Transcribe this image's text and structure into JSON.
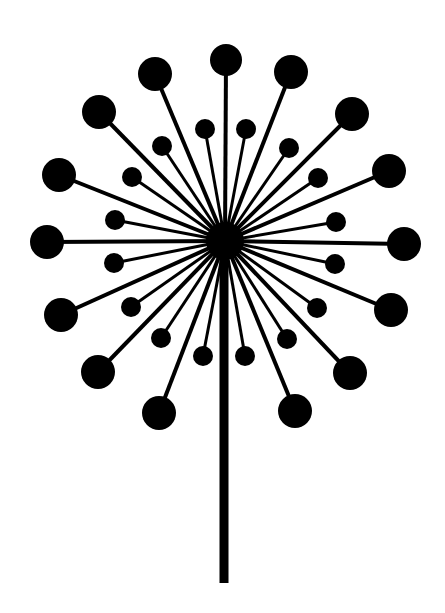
{
  "image": {
    "subject": "dandelion silhouette",
    "width": 445,
    "height": 613,
    "background": "#ffffff",
    "ink": "#000000"
  },
  "flower": {
    "hub": {
      "cx": 225,
      "cy": 241,
      "r": 19
    },
    "stem": {
      "x1": 224,
      "y1": 241,
      "x2": 224,
      "y2": 583,
      "width": 9
    },
    "outer_ray_width": 4,
    "inner_ray_width": 3,
    "outer_seeds": [
      {
        "cx": 226,
        "cy": 60,
        "r": 16
      },
      {
        "cx": 291,
        "cy": 72,
        "r": 17
      },
      {
        "cx": 155,
        "cy": 74,
        "r": 17
      },
      {
        "cx": 352,
        "cy": 114,
        "r": 17
      },
      {
        "cx": 99,
        "cy": 112,
        "r": 17
      },
      {
        "cx": 389,
        "cy": 171,
        "r": 17
      },
      {
        "cx": 59,
        "cy": 175,
        "r": 17
      },
      {
        "cx": 404,
        "cy": 244,
        "r": 17
      },
      {
        "cx": 47,
        "cy": 242,
        "r": 17
      },
      {
        "cx": 61,
        "cy": 315,
        "r": 17
      },
      {
        "cx": 391,
        "cy": 310,
        "r": 17
      },
      {
        "cx": 98,
        "cy": 372,
        "r": 17
      },
      {
        "cx": 350,
        "cy": 373,
        "r": 17
      },
      {
        "cx": 159,
        "cy": 413,
        "r": 17
      },
      {
        "cx": 295,
        "cy": 411,
        "r": 17
      }
    ],
    "inner_seeds": [
      {
        "cx": 205,
        "cy": 129,
        "r": 10
      },
      {
        "cx": 246,
        "cy": 129,
        "r": 10
      },
      {
        "cx": 162,
        "cy": 146,
        "r": 10
      },
      {
        "cx": 289,
        "cy": 148,
        "r": 10
      },
      {
        "cx": 132,
        "cy": 177,
        "r": 10
      },
      {
        "cx": 318,
        "cy": 178,
        "r": 10
      },
      {
        "cx": 115,
        "cy": 220,
        "r": 10
      },
      {
        "cx": 336,
        "cy": 222,
        "r": 10
      },
      {
        "cx": 114,
        "cy": 263,
        "r": 10
      },
      {
        "cx": 335,
        "cy": 264,
        "r": 10
      },
      {
        "cx": 131,
        "cy": 307,
        "r": 10
      },
      {
        "cx": 317,
        "cy": 308,
        "r": 10
      },
      {
        "cx": 161,
        "cy": 338,
        "r": 10
      },
      {
        "cx": 287,
        "cy": 339,
        "r": 10
      },
      {
        "cx": 203,
        "cy": 356,
        "r": 10
      },
      {
        "cx": 245,
        "cy": 356,
        "r": 10
      }
    ]
  }
}
